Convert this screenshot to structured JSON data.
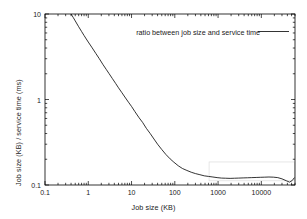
{
  "chart_data": {
    "type": "line",
    "title": "",
    "subtitle": "",
    "xlabel": "Job size (KB)",
    "ylabel": "Job size (KB) / service time (ms)",
    "xscale": "log",
    "yscale": "log",
    "xlim": [
      0.1,
      60000
    ],
    "ylim": [
      0.1,
      10
    ],
    "grid": false,
    "legend_position": "top-right-inside",
    "xticks": [
      {
        "value": 0.1,
        "label": "0.1"
      },
      {
        "value": 1,
        "label": "1"
      },
      {
        "value": 10,
        "label": "10"
      },
      {
        "value": 100,
        "label": "100"
      },
      {
        "value": 1000,
        "label": "1000"
      },
      {
        "value": 10000,
        "label": "10000"
      }
    ],
    "yticks": [
      {
        "value": 0.1,
        "label": "0.1"
      },
      {
        "value": 1,
        "label": "1"
      },
      {
        "value": 10,
        "label": "10"
      }
    ],
    "series": [
      {
        "name": "ratio between job size and service time",
        "color": "#000000",
        "x": [
          0.4,
          0.45,
          0.5,
          0.6,
          0.7,
          0.8,
          0.9,
          1.0,
          1.2,
          1.5,
          1.8,
          2.2,
          2.6,
          3.0,
          3.6,
          4.3,
          5.0,
          6.0,
          7.0,
          8.5,
          10,
          12,
          15,
          18,
          22,
          27,
          33,
          40,
          50,
          62,
          78,
          95,
          120,
          150,
          190,
          240,
          300,
          380,
          480,
          600,
          760,
          950,
          1200,
          1500,
          1900,
          2400,
          3000,
          3800,
          4800,
          6000,
          7600,
          9500,
          12000,
          15000,
          19000,
          24000,
          30000,
          38000,
          45000,
          52000,
          58000
        ],
        "y": [
          10.0,
          9.1,
          8.3,
          7.1,
          6.25,
          5.6,
          5.1,
          4.7,
          4.1,
          3.45,
          3.0,
          2.55,
          2.25,
          2.02,
          1.76,
          1.54,
          1.37,
          1.2,
          1.07,
          0.93,
          0.83,
          0.72,
          0.61,
          0.54,
          0.46,
          0.4,
          0.345,
          0.3,
          0.26,
          0.228,
          0.202,
          0.185,
          0.168,
          0.156,
          0.148,
          0.141,
          0.136,
          0.132,
          0.128,
          0.126,
          0.124,
          0.122,
          0.1205,
          0.12,
          0.1195,
          0.12,
          0.1205,
          0.121,
          0.1215,
          0.122,
          0.1225,
          0.123,
          0.1235,
          0.124,
          0.1235,
          0.122,
          0.118,
          0.112,
          0.108,
          0.113,
          0.122
        ]
      }
    ],
    "annotations": [
      {
        "type": "rect-artifact",
        "x0": 620,
        "x1": 58000,
        "y0": 0.112,
        "y1": 0.186,
        "color": "#dcdcdc"
      }
    ]
  },
  "legend": {
    "entries": [
      {
        "label": "ratio between job size and service time",
        "color": "#000000"
      }
    ]
  },
  "axes": {
    "x_title": "Job size (KB)",
    "y_title": "Job size (KB) / service time (ms)"
  },
  "style": {
    "background": "#ffffff",
    "axis_color": "#000000",
    "line_color": "#000000"
  }
}
